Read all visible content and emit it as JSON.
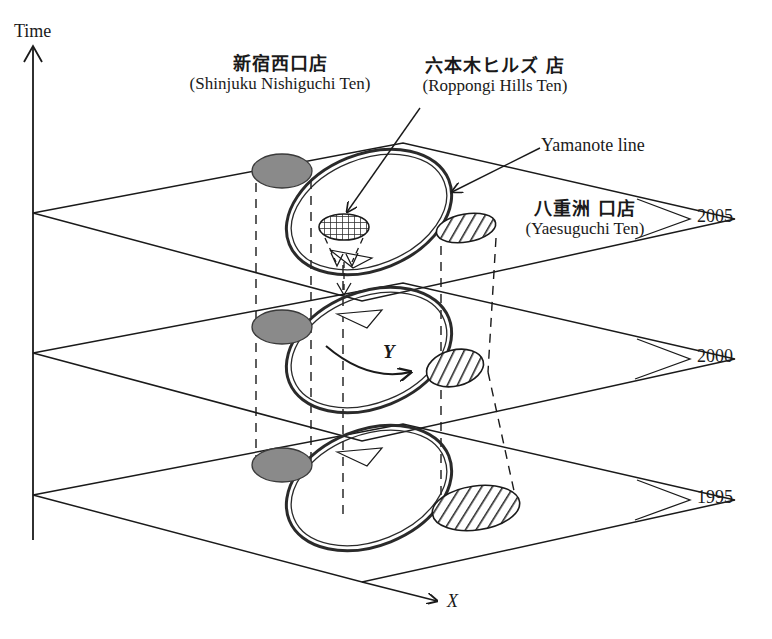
{
  "figure": {
    "type": "spatio-temporal-3d-diagram",
    "axes": {
      "vertical_label": "Time",
      "horizontal_label": "X",
      "depth_label": "Y"
    },
    "time_slices": [
      {
        "year": "2005",
        "index": 0
      },
      {
        "year": "2000",
        "index": 1
      },
      {
        "year": "1995",
        "index": 2
      }
    ],
    "annotations": [
      {
        "id": "shinjuku",
        "jp": "新宿西口店",
        "romaji": "(Shinjuku Nishiguchi Ten)",
        "symbol": "solid-gray-ellipse"
      },
      {
        "id": "roppongi",
        "jp": "六本木ヒルズ 店",
        "romaji": "(Roppongi Hills Ten)",
        "symbol": "cross-hatched-ellipse"
      },
      {
        "id": "yaesu",
        "jp": "八重洲 口店",
        "romaji": "(Yaesuguchi Ten)",
        "symbol": "diagonal-hatched-ellipse"
      },
      {
        "id": "yamanote",
        "text": "Yamanote line",
        "symbol": "double-stroke-ellipse-ring"
      }
    ],
    "colors": {
      "stroke": "#1a1a1a",
      "gray_fill": "#8a8a8a",
      "background": "#ffffff"
    }
  }
}
